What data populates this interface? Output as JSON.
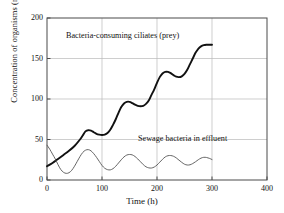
{
  "chart_data": {
    "type": "line",
    "title": "",
    "xlabel": "Time (h)",
    "ylabel": "Concentration of organisms (mg·L⁻¹)",
    "ylabel_main": "Concentration of organisms (mg·L",
    "ylabel_exponent": "−1",
    "ylabel_tail": ")",
    "xlim": [
      0,
      400
    ],
    "ylim": [
      0,
      200
    ],
    "xticks": [
      "0",
      "100",
      "200",
      "300",
      "400"
    ],
    "xtick_values": [
      0,
      100,
      200,
      300,
      400
    ],
    "yticks": [
      "0",
      "50",
      "100",
      "150",
      "200"
    ],
    "ytick_values": [
      0,
      50,
      100,
      150,
      200
    ],
    "grid": "horizontal-and-vertical",
    "grid_color": "#b9b9b9",
    "axis_color": "#4a4a4a",
    "legend": "inline-annotations",
    "series": [
      {
        "name": "Bacteria-consuming ciliates (prey)",
        "color": "#111111",
        "line_width": 1.9,
        "annotation_x": 150,
        "annotation_y": 178,
        "x": [
          0,
          10,
          20,
          30,
          40,
          50,
          60,
          65,
          70,
          75,
          80,
          85,
          90,
          95,
          100,
          105,
          110,
          115,
          120,
          125,
          130,
          135,
          140,
          145,
          150,
          155,
          160,
          165,
          170,
          175,
          180,
          185,
          190,
          195,
          200,
          205,
          210,
          215,
          220,
          225,
          230,
          235,
          240,
          245,
          250,
          255,
          260,
          265,
          270,
          275,
          280,
          285,
          290,
          295,
          300
        ],
        "y": [
          17,
          21,
          26,
          31,
          36,
          42,
          50,
          55,
          60,
          61.5,
          61,
          59,
          57,
          56,
          55.5,
          56,
          58,
          62,
          68,
          75,
          83,
          90,
          94.5,
          96.5,
          96.5,
          95,
          93,
          91.5,
          91,
          91.5,
          94,
          98,
          105,
          112,
          120,
          127,
          131.5,
          133.5,
          133.5,
          132,
          129.5,
          127.5,
          127,
          128,
          131,
          136,
          143,
          150,
          157,
          162,
          165,
          166.5,
          167,
          167,
          167
        ]
      },
      {
        "name": "Sewage bacteria in effluent",
        "color": "#555555",
        "line_width": 0.9,
        "annotation_x": 205,
        "annotation_y": 44,
        "x": [
          0,
          5,
          10,
          15,
          20,
          25,
          30,
          35,
          40,
          45,
          50,
          55,
          60,
          65,
          70,
          75,
          80,
          85,
          90,
          95,
          100,
          105,
          110,
          115,
          120,
          125,
          130,
          135,
          140,
          145,
          150,
          155,
          160,
          165,
          170,
          175,
          180,
          185,
          190,
          195,
          200,
          205,
          210,
          215,
          220,
          225,
          230,
          235,
          240,
          245,
          250,
          255,
          260,
          265,
          270,
          275,
          280,
          285,
          290,
          295,
          300
        ],
        "y": [
          43,
          38,
          32,
          26,
          19,
          13,
          9.5,
          8.2,
          9,
          12,
          17,
          23,
          29,
          34,
          36.8,
          37.5,
          36,
          32.5,
          28,
          23,
          18,
          14.5,
          12.8,
          12.5,
          14,
          17,
          21,
          25,
          28.5,
          30.8,
          31.5,
          31,
          29,
          26,
          22.5,
          19,
          16.3,
          15,
          14.8,
          16,
          18.5,
          22,
          25.5,
          28.5,
          30,
          30.2,
          29.3,
          27.3,
          24.5,
          21.8,
          19.5,
          18.5,
          18.8,
          20.3,
          22.5,
          25,
          27,
          28,
          27.8,
          26.8,
          25.3
        ]
      }
    ]
  },
  "annotations": {
    "prey_label": "Bacteria-consuming ciliates (prey)",
    "bacteria_label": "Sewage bacteria in effluent"
  }
}
